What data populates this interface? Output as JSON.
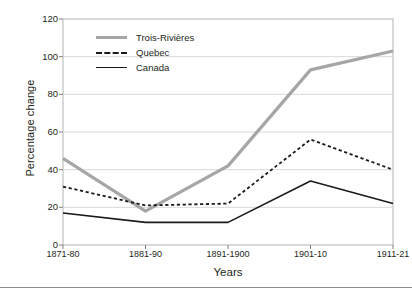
{
  "chart_data": {
    "type": "line",
    "title": "",
    "xlabel": "Years",
    "ylabel": "Percentage change",
    "categories": [
      "1871-80",
      "1881-90",
      "1891-1900",
      "1901-10",
      "1911-21"
    ],
    "ylim": [
      0,
      120
    ],
    "ytick_labels": [
      "0",
      "20",
      "40",
      "60",
      "80",
      "100",
      "120"
    ],
    "ytick_values": [
      0,
      20,
      40,
      60,
      80,
      100,
      120
    ],
    "grid": "horizontal",
    "legend_position": "upper-left-inside",
    "series": [
      {
        "name": "Trois-Rivières",
        "values": [
          46,
          18,
          42,
          93,
          103
        ],
        "color": "#a6a6a6",
        "style": "solid",
        "width": 3.2
      },
      {
        "name": "Quebec",
        "values": [
          31,
          21,
          22,
          56,
          40
        ],
        "color": "#1a1a1a",
        "style": "dashed",
        "width": 1.8
      },
      {
        "name": "Canada",
        "values": [
          17,
          12,
          12,
          34,
          22
        ],
        "color": "#1a1a1a",
        "style": "solid",
        "width": 1.6
      }
    ]
  },
  "axes": {
    "frame_color": "#b3b3b3",
    "grid_color": "#d9d9d9"
  }
}
